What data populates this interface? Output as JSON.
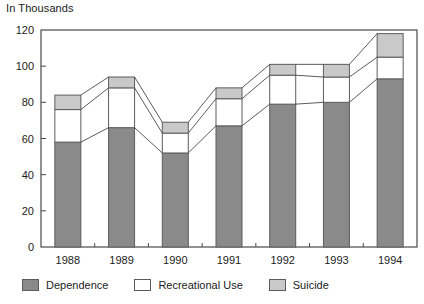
{
  "chart_data": {
    "type": "bar",
    "subtype": "stacked",
    "title": "In Thousands",
    "xlabel": "",
    "ylabel": "In Thousands",
    "categories": [
      "1988",
      "1989",
      "1990",
      "1991",
      "1992",
      "1993",
      "1994"
    ],
    "series": [
      {
        "name": "Dependence",
        "values": [
          58,
          66,
          52,
          67,
          79,
          80,
          93
        ]
      },
      {
        "name": "Recreational Use",
        "values": [
          18,
          22,
          11,
          15,
          16,
          14,
          12
        ]
      },
      {
        "name": "Suicide",
        "values": [
          8,
          6,
          6,
          6,
          6,
          7,
          13
        ]
      }
    ],
    "totals": [
      84,
      94,
      69,
      88,
      101,
      101,
      118
    ],
    "ylim": [
      0,
      120
    ],
    "yticks": [
      0,
      20,
      40,
      60,
      80,
      100,
      120
    ],
    "ytick_labels": [
      "0",
      "20",
      "40",
      "60",
      "80",
      "100",
      "120"
    ],
    "grid": false,
    "legend_position": "bottom",
    "colors": {
      "dependence": "#8a8a8a",
      "recreational_use": "#ffffff",
      "suicide": "#c9c9c9",
      "outline": "#5c5c5c",
      "axis": "#4a4a4a",
      "text": "#1b1b1b"
    }
  },
  "legend": {
    "items": [
      {
        "label": "Dependence",
        "color": "#8a8a8a"
      },
      {
        "label": "Recreational Use",
        "color": "#ffffff"
      },
      {
        "label": "Suicide",
        "color": "#c9c9c9"
      }
    ]
  }
}
